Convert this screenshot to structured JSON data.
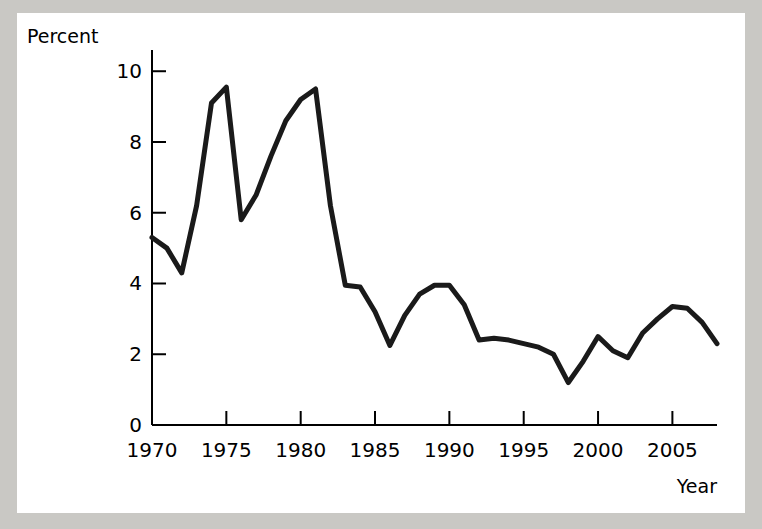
{
  "figure": {
    "background_color": "#c9c8c4",
    "card_color": "#ffffff",
    "line_color": "#1a1a1a",
    "axis_color": "#000000"
  },
  "chart_data": {
    "type": "line",
    "title": "",
    "subtitle": "",
    "xlabel": "Year",
    "ylabel": "Percent",
    "xlim": [
      1970,
      2008
    ],
    "ylim": [
      0,
      10.6
    ],
    "grid": false,
    "legend": null,
    "legend_position": "none",
    "x_ticks": [
      1970,
      1975,
      1980,
      1985,
      1990,
      1995,
      2000,
      2005
    ],
    "x_tick_labels": [
      "1970",
      "1975",
      "1980",
      "1985",
      "1990",
      "1995",
      "2000",
      "2005"
    ],
    "y_ticks": [
      0,
      2,
      4,
      6,
      8,
      10
    ],
    "y_tick_labels": [
      "0",
      "2",
      "4",
      "6",
      "8",
      "10"
    ],
    "tick_direction": "in",
    "series": [
      {
        "name": "Percent",
        "x": [
          1970,
          1971,
          1972,
          1973,
          1974,
          1975,
          1976,
          1977,
          1978,
          1979,
          1980,
          1981,
          1982,
          1983,
          1984,
          1985,
          1986,
          1987,
          1988,
          1989,
          1990,
          1991,
          1992,
          1993,
          1994,
          1995,
          1996,
          1997,
          1998,
          1999,
          2000,
          2001,
          2002,
          2003,
          2004,
          2005,
          2006,
          2007,
          2008
        ],
        "values": [
          5.3,
          5.0,
          4.3,
          6.2,
          9.1,
          9.55,
          5.8,
          6.5,
          7.6,
          8.6,
          9.2,
          9.5,
          6.2,
          3.95,
          3.9,
          3.2,
          2.25,
          3.1,
          3.7,
          3.95,
          3.95,
          3.4,
          2.4,
          2.45,
          2.4,
          2.3,
          2.2,
          2.0,
          1.2,
          1.8,
          2.5,
          2.1,
          1.9,
          2.6,
          3.0,
          3.35,
          3.3,
          2.9,
          2.3
        ]
      }
    ],
    "annotations": []
  },
  "axes": {
    "y_axis_title": "Percent",
    "x_axis_title": "Year"
  }
}
